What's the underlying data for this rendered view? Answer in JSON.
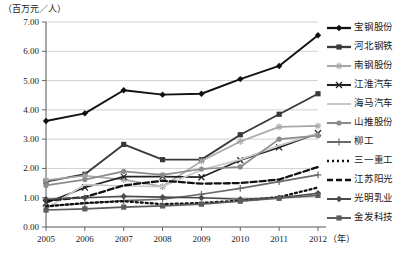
{
  "axis_unit_y": "（百万元／人）",
  "axis_unit_x": "（年）",
  "yticks": [
    "0.00",
    "1.00",
    "2.00",
    "3.00",
    "4.00",
    "5.00",
    "6.00",
    "7.00"
  ],
  "xticks": [
    "2005",
    "2006",
    "2007",
    "2008",
    "2009",
    "2010",
    "2011",
    "2012"
  ],
  "legend": [
    {
      "label": "宝钢股份"
    },
    {
      "label": "河北钢铁"
    },
    {
      "label": "南钢股份"
    },
    {
      "label": "江淮汽车"
    },
    {
      "label": "海马汽车"
    },
    {
      "label": "山推股份"
    },
    {
      "label": "柳工"
    },
    {
      "label": "三一重工"
    },
    {
      "label": "江苏阳光"
    },
    {
      "label": "光明乳业"
    },
    {
      "label": "金发科技"
    }
  ],
  "chart_data": {
    "type": "line",
    "title": "",
    "xlabel": "（年）",
    "ylabel": "（百万元／人）",
    "categories": [
      "2005",
      "2006",
      "2007",
      "2008",
      "2009",
      "2010",
      "2011",
      "2012"
    ],
    "ylim": [
      0.0,
      7.0
    ],
    "ytick_step": 1.0,
    "grid": true,
    "legend_position": "right",
    "series": [
      {
        "name": "宝钢股份",
        "color": "#111111",
        "marker": "diamond",
        "dash": "none",
        "width": 1.9,
        "values": [
          3.62,
          3.88,
          4.67,
          4.52,
          4.55,
          5.05,
          5.5,
          6.55
        ]
      },
      {
        "name": "河北钢铁",
        "color": "#3a3a3a",
        "marker": "square",
        "dash": "none",
        "width": 1.9,
        "values": [
          1.55,
          1.8,
          2.82,
          2.3,
          2.3,
          3.15,
          3.85,
          4.55
        ]
      },
      {
        "name": "南钢股份",
        "color": "#a8a8a8",
        "marker": "star",
        "dash": "none",
        "width": 1.7,
        "values": [
          1.6,
          1.75,
          1.62,
          1.38,
          2.25,
          2.92,
          3.42,
          3.45
        ]
      },
      {
        "name": "江淮汽车",
        "color": "#222222",
        "marker": "cross",
        "dash": "none",
        "width": 1.7,
        "values": [
          0.82,
          1.35,
          1.72,
          1.72,
          1.7,
          2.28,
          2.72,
          3.2
        ]
      },
      {
        "name": "海马汽车",
        "color": "#c9c9c9",
        "marker": "line",
        "dash": "none",
        "width": 1.7,
        "values": [
          0.62,
          1.45,
          1.4,
          1.38,
          1.95,
          2.3,
          2.78,
          3.2
        ]
      },
      {
        "name": "山推股份",
        "color": "#8c8c8c",
        "marker": "circle",
        "dash": "none",
        "width": 1.7,
        "values": [
          1.42,
          1.62,
          1.9,
          1.78,
          1.98,
          2.05,
          3.0,
          3.12
        ]
      },
      {
        "name": "柳工",
        "color": "#6a6a6a",
        "marker": "plus",
        "dash": "none",
        "width": 1.6,
        "values": [
          0.72,
          0.8,
          0.9,
          0.95,
          1.12,
          1.32,
          1.55,
          1.78
        ]
      },
      {
        "name": "三一重工",
        "color": "#111111",
        "marker": "dot",
        "dash": "2,3",
        "width": 2.3,
        "values": [
          0.7,
          0.82,
          0.88,
          0.78,
          0.82,
          0.9,
          1.02,
          1.35
        ]
      },
      {
        "name": "江苏阳光",
        "color": "#111111",
        "marker": "dash",
        "dash": "6,3",
        "width": 2.3,
        "values": [
          0.9,
          1.02,
          1.42,
          1.58,
          1.48,
          1.5,
          1.62,
          2.05
        ]
      },
      {
        "name": "光明乳业",
        "color": "#4a4a4a",
        "marker": "diamond",
        "dash": "none",
        "width": 1.6,
        "values": [
          0.95,
          1.0,
          1.05,
          1.02,
          1.0,
          0.95,
          1.0,
          1.15
        ]
      },
      {
        "name": "金发科技",
        "color": "#5c5c5c",
        "marker": "square",
        "dash": "none",
        "width": 1.6,
        "values": [
          0.58,
          0.62,
          0.68,
          0.72,
          0.78,
          0.88,
          0.98,
          1.08
        ]
      }
    ]
  }
}
